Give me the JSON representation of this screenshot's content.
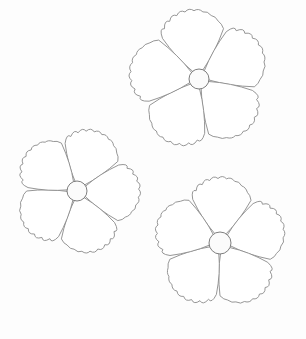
{
  "image": {
    "description": "Pencil line sketch of three five-petal flowers with ruffled petal edges on a white background",
    "background_color": "#fdfdfd",
    "stroke_color": "#8a8a8a"
  },
  "flowers": [
    {
      "name": "top-right-flower",
      "cx": 199,
      "cy": 79,
      "radius": 70,
      "center_radius": 10,
      "rotation": -8
    },
    {
      "name": "left-flower",
      "cx": 77,
      "cy": 191,
      "radius": 63,
      "center_radius": 10,
      "rotation": 20
    },
    {
      "name": "bottom-right-flower",
      "cx": 220,
      "cy": 243,
      "radius": 66,
      "center_radius": 11,
      "rotation": 2
    }
  ]
}
